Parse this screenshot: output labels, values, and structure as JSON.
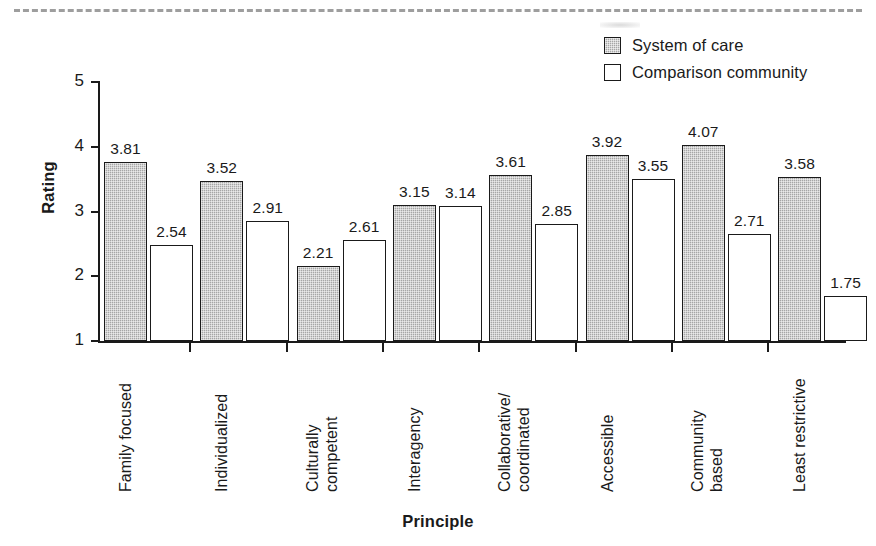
{
  "figure": {
    "y_axis_title": "Rating",
    "x_axis_title": "Principle",
    "y_ticks": [
      "5",
      "4",
      "3",
      "2",
      "1"
    ]
  },
  "legend": {
    "items": [
      {
        "label": "System of care",
        "swatch": "filled-gray-square-icon",
        "color": "#a6a6a6"
      },
      {
        "label": "Comparison community",
        "swatch": "open-white-square-icon",
        "color": "#ffffff"
      }
    ]
  },
  "chart_data": {
    "type": "bar",
    "title": "",
    "xlabel": "Principle",
    "ylabel": "Rating",
    "ylim": [
      1,
      5
    ],
    "ytick_values": [
      1,
      2,
      3,
      4,
      5
    ],
    "grid": false,
    "legend_position": "top-right",
    "categories": [
      "Family focused",
      "Individualized",
      "Culturally competent",
      "Interagency",
      "Collaborative/ coordinated",
      "Accessible",
      "Community based",
      "Least restrictive"
    ],
    "category_lines": [
      [
        "Family focused"
      ],
      [
        "Individualized"
      ],
      [
        "Culturally",
        "competent"
      ],
      [
        "Interagency"
      ],
      [
        "Collaborative/",
        "coordinated"
      ],
      [
        "Accessible"
      ],
      [
        "Community",
        "based"
      ],
      [
        "Least restrictive"
      ]
    ],
    "series": [
      {
        "name": "System of care",
        "color": "#a6a6a6",
        "values": [
          3.81,
          3.52,
          2.21,
          3.15,
          3.61,
          3.92,
          4.07,
          3.58
        ],
        "labels": [
          "3.81",
          "3.52",
          "2.21",
          "3.15",
          "3.61",
          "3.92",
          "4.07",
          "3.58"
        ]
      },
      {
        "name": "Comparison community",
        "color": "#ffffff",
        "values": [
          2.54,
          2.91,
          2.61,
          3.14,
          2.85,
          3.55,
          2.71,
          1.75
        ],
        "labels": [
          "2.54",
          "2.91",
          "2.61",
          "3.14",
          "2.85",
          "3.55",
          "2.71",
          "1.75"
        ]
      }
    ]
  }
}
